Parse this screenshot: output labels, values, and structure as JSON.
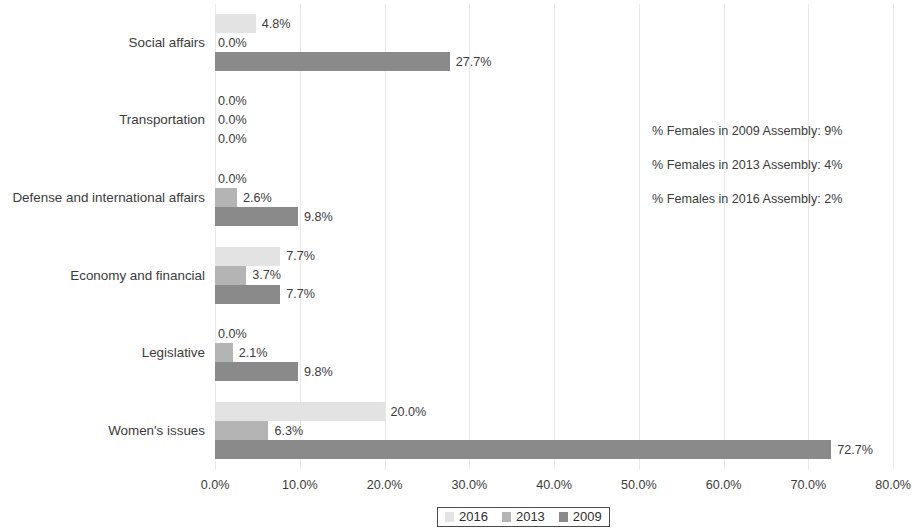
{
  "chart_data": {
    "type": "bar",
    "orientation": "horizontal",
    "title": "",
    "subtitle": "",
    "xlabel": "",
    "ylabel": "",
    "xlim": [
      0,
      80
    ],
    "xticks": [
      "0.0%",
      "10.0%",
      "20.0%",
      "30.0%",
      "40.0%",
      "50.0%",
      "60.0%",
      "70.0%",
      "80.0%"
    ],
    "xtick_values": [
      0,
      10,
      20,
      30,
      40,
      50,
      60,
      70,
      80
    ],
    "grid": true,
    "grid_axis": "x",
    "legend_position": "bottom",
    "categories": [
      "Social affairs",
      "Transportation",
      "Defense and international affairs",
      "Economy and financial",
      "Legislative",
      "Women's issues"
    ],
    "series": [
      {
        "name": "2016",
        "color": "#e3e3e3",
        "values": [
          4.8,
          0.0,
          0.0,
          7.7,
          0.0,
          20.0
        ],
        "labels": [
          "4.8%",
          "0.0%",
          "0.0%",
          "7.7%",
          "0.0%",
          "20.0%"
        ]
      },
      {
        "name": "2013",
        "color": "#b4b4b4",
        "values": [
          0.0,
          0.0,
          2.6,
          3.7,
          2.1,
          6.3
        ],
        "labels": [
          "0.0%",
          "0.0%",
          "2.6%",
          "3.7%",
          "2.1%",
          "6.3%"
        ]
      },
      {
        "name": "2009",
        "color": "#8a8a8a",
        "values": [
          27.7,
          0.0,
          9.8,
          7.7,
          9.8,
          72.7
        ],
        "labels": [
          "27.7%",
          "0.0%",
          "9.8%",
          "7.7%",
          "9.8%",
          "72.7%"
        ]
      }
    ],
    "annotations": [
      "% Females in 2009 Assembly: 9%",
      "% Females in 2013 Assembly: 4%",
      "% Females in 2016 Assembly: 2%"
    ]
  },
  "legend": {
    "entries": [
      "2016",
      "2013",
      "2009"
    ]
  },
  "colors": {
    "series_2016": "#e3e3e3",
    "series_2013": "#b4b4b4",
    "series_2009": "#8a8a8a",
    "text": "#3b3b3b",
    "gridline": "#e9e9e9",
    "background": "#ffffff"
  }
}
